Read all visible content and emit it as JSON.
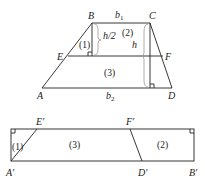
{
  "top_figure": {
    "vertices": {
      "A": "A",
      "B": "B",
      "C": "C",
      "D": "D",
      "E": "E",
      "F": "F"
    },
    "bases": {
      "top": "b",
      "top_sub": "1",
      "bottom": "b",
      "bottom_sub": "2"
    },
    "heights": {
      "half": "h/2",
      "full": "h"
    },
    "regions": [
      "(1)",
      "(2)",
      "(3)"
    ]
  },
  "bottom_figure": {
    "vertices": {
      "A": "A′",
      "E": "E′",
      "F": "F′",
      "D": "D′",
      "B": "B′"
    },
    "regions": [
      "(1)",
      "(3)",
      "(2)"
    ]
  }
}
